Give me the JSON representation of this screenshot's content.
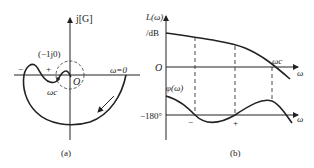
{
  "panel_a": {
    "caption": "(a)",
    "axis_label_imag": "j[G]",
    "point_label": "(−1j0)",
    "origin_label": "O",
    "omega_zero_label": "ω=0",
    "crossover_label": "ωc",
    "sign_minus": "−",
    "sign_plus": "+"
  },
  "panel_b": {
    "caption": "(b)",
    "magnitude_axis_label": "L(ω)",
    "magnitude_unit": "/dB",
    "origin_label": "O",
    "crossover_label": "ωc",
    "omega_label_top": "ω",
    "phase_axis_label": "φ(ω)",
    "phase_ref_label": "−180°",
    "omega_label_bottom": "ω",
    "sign_minus": "−",
    "sign_plus": "+"
  },
  "colors": {
    "line": "#222222",
    "background": "#ffffff"
  }
}
